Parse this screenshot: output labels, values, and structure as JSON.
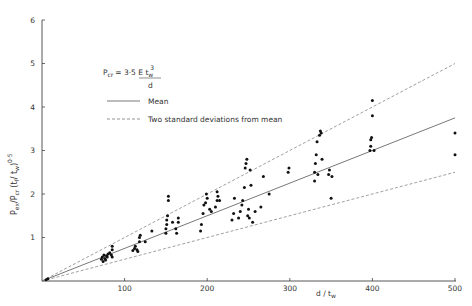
{
  "chart_data": {
    "type": "scatter",
    "title": "",
    "xlabel": "d / t_w",
    "ylabel": "P_ex / (P_cr (t_f / t_w)^0.5)",
    "xlim": [
      0,
      500
    ],
    "ylim": [
      0,
      6
    ],
    "x_ticks": [
      100,
      200,
      300,
      400,
      500
    ],
    "y_ticks": [
      1,
      2,
      3,
      4,
      5,
      6
    ],
    "grid": false,
    "legend_position": "upper-left inside plot",
    "formula": {
      "lhs": "P_cr",
      "rhs": "3·5 E t_w^3 / d"
    },
    "legend": [
      {
        "label": "Mean",
        "style": "solid"
      },
      {
        "label": "Two standard deviations from mean",
        "style": "dashed"
      }
    ],
    "lines": [
      {
        "name": "Mean",
        "style": "solid",
        "x": [
          0,
          500
        ],
        "y": [
          0,
          3.75
        ]
      },
      {
        "name": "Upper (+2 SD)",
        "style": "dashed",
        "x": [
          0,
          500
        ],
        "y": [
          0,
          5.0
        ]
      },
      {
        "name": "Lower (-2 SD)",
        "style": "dashed",
        "x": [
          0,
          500
        ],
        "y": [
          0,
          2.5
        ]
      }
    ],
    "series": [
      {
        "name": "Test results",
        "points": [
          [
            5,
            0.03
          ],
          [
            7,
            0.05
          ],
          [
            72,
            0.5
          ],
          [
            73,
            0.55
          ],
          [
            74,
            0.45
          ],
          [
            75,
            0.6
          ],
          [
            76,
            0.52
          ],
          [
            77,
            0.48
          ],
          [
            78,
            0.58
          ],
          [
            79,
            0.55
          ],
          [
            80,
            0.62
          ],
          [
            82,
            0.65
          ],
          [
            84,
            0.6
          ],
          [
            85,
            0.72
          ],
          [
            85,
            0.8
          ],
          [
            85,
            0.55
          ],
          [
            110,
            0.7
          ],
          [
            112,
            0.75
          ],
          [
            113,
            0.8
          ],
          [
            115,
            0.72
          ],
          [
            116,
            0.68
          ],
          [
            118,
            0.9
          ],
          [
            118,
            1.0
          ],
          [
            119,
            1.05
          ],
          [
            125,
            0.9
          ],
          [
            133,
            1.15
          ],
          [
            150,
            1.1
          ],
          [
            150,
            1.2
          ],
          [
            151,
            1.3
          ],
          [
            151,
            1.4
          ],
          [
            152,
            1.5
          ],
          [
            153,
            1.85
          ],
          [
            153,
            1.95
          ],
          [
            158,
            1.35
          ],
          [
            162,
            1.2
          ],
          [
            163,
            1.1
          ],
          [
            165,
            1.35
          ],
          [
            165,
            1.45
          ],
          [
            192,
            1.15
          ],
          [
            193,
            1.3
          ],
          [
            195,
            1.55
          ],
          [
            196,
            1.75
          ],
          [
            198,
            1.8
          ],
          [
            199,
            2.0
          ],
          [
            200,
            1.9
          ],
          [
            203,
            1.65
          ],
          [
            205,
            1.6
          ],
          [
            210,
            1.7
          ],
          [
            212,
            1.85
          ],
          [
            212,
            2.05
          ],
          [
            213,
            1.95
          ],
          [
            215,
            1.85
          ],
          [
            230,
            1.4
          ],
          [
            232,
            1.55
          ],
          [
            233,
            1.9
          ],
          [
            238,
            1.45
          ],
          [
            240,
            1.6
          ],
          [
            242,
            1.75
          ],
          [
            243,
            1.85
          ],
          [
            245,
            2.15
          ],
          [
            246,
            2.6
          ],
          [
            247,
            2.7
          ],
          [
            248,
            2.8
          ],
          [
            249,
            1.5
          ],
          [
            250,
            1.65
          ],
          [
            251,
            1.45
          ],
          [
            252,
            2.55
          ],
          [
            253,
            2.2
          ],
          [
            255,
            1.35
          ],
          [
            258,
            1.6
          ],
          [
            265,
            1.7
          ],
          [
            268,
            2.4
          ],
          [
            275,
            2.0
          ],
          [
            298,
            2.5
          ],
          [
            299,
            2.6
          ],
          [
            330,
            2.3
          ],
          [
            330,
            2.5
          ],
          [
            331,
            2.7
          ],
          [
            332,
            2.9
          ],
          [
            333,
            3.2
          ],
          [
            334,
            2.45
          ],
          [
            336,
            3.35
          ],
          [
            337,
            3.45
          ],
          [
            338,
            3.4
          ],
          [
            339,
            2.8
          ],
          [
            347,
            2.45
          ],
          [
            348,
            2.55
          ],
          [
            350,
            1.9
          ],
          [
            351,
            2.4
          ],
          [
            397,
            3.0
          ],
          [
            398,
            3.1
          ],
          [
            398,
            3.25
          ],
          [
            399,
            3.3
          ],
          [
            400,
            3.8
          ],
          [
            400,
            4.15
          ],
          [
            402,
            3.0
          ],
          [
            500,
            3.4
          ],
          [
            500,
            2.9
          ]
        ]
      }
    ]
  },
  "axes": {
    "x_tick_labels": [
      "100",
      "200",
      "300",
      "400",
      "500"
    ],
    "y_tick_labels": [
      "1",
      "2",
      "3",
      "4",
      "5",
      "6"
    ],
    "x_title_main": "d / t",
    "x_title_sub": "w"
  },
  "legend": {
    "formula_lhs": "P",
    "formula_lhs_sub": "cr",
    "formula_eq": "= 3·5 E t",
    "formula_sub": "w",
    "formula_sup": "3",
    "formula_den": "d",
    "mean_label": "Mean",
    "sd_label": "Two standard deviations from mean"
  },
  "y_title": {
    "p1": "P",
    "p1_sub": "ex",
    "slash": "/",
    "p2": "P",
    "p2_sub": "cr",
    "ratio": "(t",
    "ratio_sub1": "f",
    "ratio_mid": "/ t",
    "ratio_sub2": "w",
    "close": ")",
    "exp": "0·5"
  }
}
